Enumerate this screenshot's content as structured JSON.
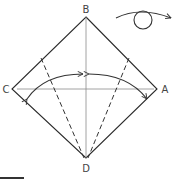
{
  "diagram": {
    "labels": {
      "top": "B",
      "left": "C",
      "right": "A",
      "bottom": "D"
    },
    "symbols": {
      "turn_over": "turn-over-icon",
      "valley_fold_arrows": [
        "fold-arrow-left",
        "fold-arrow-right"
      ]
    },
    "colors": {
      "line": "#2a2a2a",
      "crease": "#8a8a8a",
      "background": "#ffffff"
    }
  }
}
